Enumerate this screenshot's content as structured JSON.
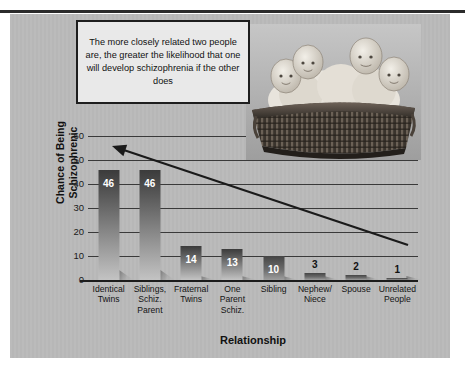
{
  "figure": {
    "caption_note": "The more closely related two people are, the greater the likelihood that one will develop schizophrenia if the other does",
    "photo_alt": "four-babies-in-basket-photo",
    "panel_color": "#b9b9b9",
    "rule_color": "#2b2b2b"
  },
  "chart_data": {
    "type": "bar",
    "title": "",
    "xlabel": "Relationship",
    "ylabel": "Chance of Being Schizophrenic",
    "ylabel_line1": "Chance of Being",
    "ylabel_line2": "Schizophrenic",
    "ylim": [
      0,
      60
    ],
    "yticks": [
      60,
      50,
      40,
      30,
      20,
      10,
      0
    ],
    "ytick_labels": [
      "60",
      "50",
      "40",
      "30",
      "20",
      "10",
      "0"
    ],
    "grid": true,
    "legend": "none",
    "categories": [
      "Identical Twins",
      "Siblings, Schiz. Parent",
      "Fraternal Twins",
      "One Parent Schiz.",
      "Sibling",
      "Nephew/ Niece",
      "Spouse",
      "Unrelated People"
    ],
    "category_lines": [
      [
        "Identical",
        "Twins"
      ],
      [
        "Siblings,",
        "Schiz.",
        "Parent"
      ],
      [
        "Fraternal",
        "Twins"
      ],
      [
        "One",
        "Parent",
        "Schiz."
      ],
      [
        "Sibling"
      ],
      [
        "Nephew/",
        "Niece"
      ],
      [
        "Spouse"
      ],
      [
        "Unrelated",
        "People"
      ]
    ],
    "values": [
      46,
      46,
      14,
      13,
      10,
      3,
      2,
      1
    ],
    "value_labels": [
      "46",
      "46",
      "14",
      "13",
      "10",
      "3",
      "2",
      "1"
    ],
    "annotation": {
      "type": "arrow",
      "text": "",
      "direction": "up-left",
      "from": [
        408,
        245
      ],
      "to": [
        112,
        146
      ]
    }
  }
}
